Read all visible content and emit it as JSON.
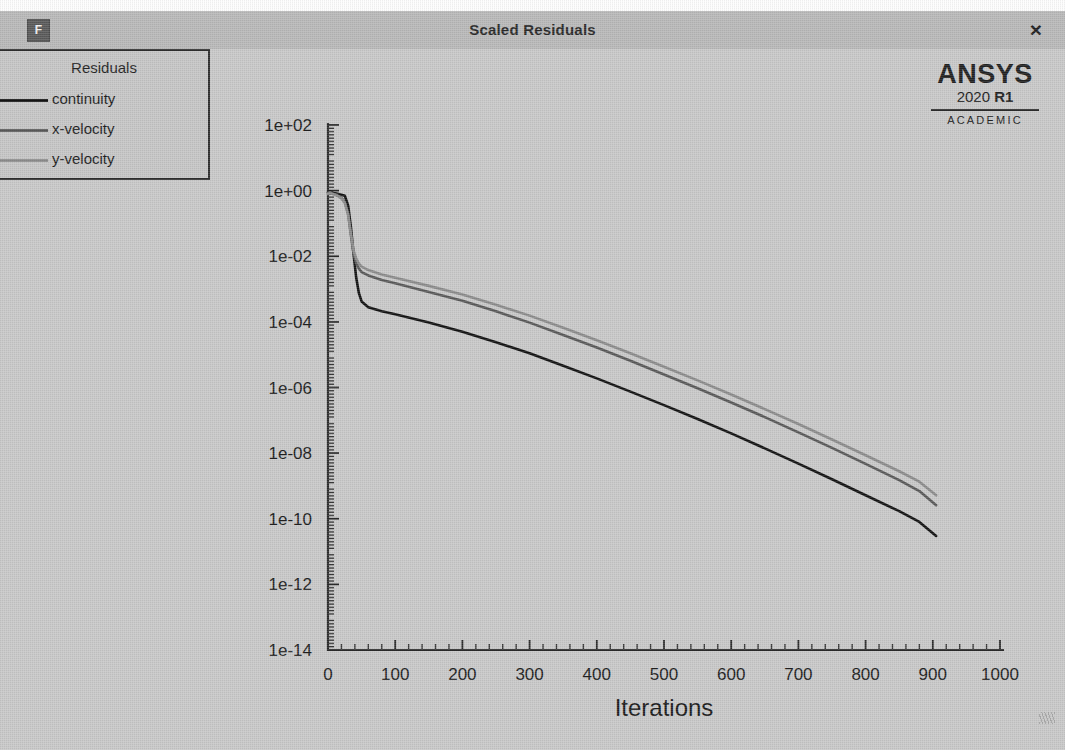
{
  "window": {
    "title": "Scaled Residuals",
    "app_icon_label": "F",
    "close_label": "×"
  },
  "branding": {
    "brand": "ANSYS",
    "version_year": "2020",
    "version_release": "R1",
    "license": "ACADEMIC"
  },
  "legend": {
    "title": "Residuals",
    "items": [
      {
        "label": "continuity",
        "color": "#141414"
      },
      {
        "label": "x-velocity",
        "color": "#5a5a5a"
      },
      {
        "label": "y-velocity",
        "color": "#8c8c8c"
      }
    ]
  },
  "chart_data": {
    "type": "line",
    "title": "Scaled Residuals",
    "xlabel": "Iterations",
    "ylabel": "",
    "yscale": "log",
    "xlim": [
      0,
      1000
    ],
    "ylim": [
      1e-14,
      100.0
    ],
    "grid": false,
    "legend_position": "top-left",
    "xticks": [
      0,
      100,
      200,
      300,
      400,
      500,
      600,
      700,
      800,
      900,
      1000
    ],
    "xtick_labels": [
      "0",
      "100",
      "200",
      "300",
      "400",
      "500",
      "600",
      "700",
      "800",
      "900",
      "1000"
    ],
    "xminor_step": 20,
    "yticks": [
      100.0,
      1,
      0.01,
      0.0001,
      1e-06,
      1e-08,
      1e-10,
      1e-12,
      1e-14
    ],
    "ytick_labels": [
      "1e+02",
      "1e+00",
      "1e-02",
      "1e-04",
      "1e-06",
      "1e-08",
      "1e-10",
      "1e-12",
      "1e-14"
    ],
    "series": [
      {
        "name": "continuity",
        "color": "#141414",
        "width": 2.6,
        "x": [
          0,
          3,
          8,
          14,
          20,
          25,
          30,
          34,
          38,
          42,
          46,
          50,
          60,
          80,
          100,
          150,
          200,
          250,
          300,
          350,
          400,
          450,
          500,
          550,
          600,
          650,
          700,
          750,
          800,
          850,
          880,
          905
        ],
        "y": [
          0.9,
          0.95,
          0.85,
          0.8,
          0.75,
          0.7,
          0.35,
          0.08,
          0.012,
          0.0022,
          0.00075,
          0.00042,
          0.00028,
          0.00021,
          0.00017,
          9.5e-05,
          5e-05,
          2.4e-05,
          1.1e-05,
          4.6e-06,
          1.9e-06,
          7.5e-07,
          2.9e-07,
          1.1e-07,
          4e-08,
          1.4e-08,
          4.8e-09,
          1.6e-09,
          5.2e-10,
          1.7e-10,
          8e-11,
          3e-11
        ]
      },
      {
        "name": "x-velocity",
        "color": "#5a5a5a",
        "width": 2.6,
        "x": [
          0,
          3,
          8,
          14,
          20,
          25,
          30,
          34,
          38,
          42,
          46,
          50,
          60,
          80,
          100,
          150,
          200,
          250,
          300,
          350,
          400,
          450,
          500,
          550,
          600,
          650,
          700,
          750,
          800,
          850,
          880,
          905
        ],
        "y": [
          0.85,
          0.9,
          0.8,
          0.72,
          0.6,
          0.45,
          0.2,
          0.045,
          0.012,
          0.0062,
          0.0042,
          0.0033,
          0.0026,
          0.0019,
          0.0015,
          0.00082,
          0.00044,
          0.00021,
          9.5e-05,
          4e-05,
          1.65e-05,
          6.5e-06,
          2.5e-06,
          9.5e-07,
          3.5e-07,
          1.25e-07,
          4.3e-08,
          1.45e-08,
          4.7e-09,
          1.5e-09,
          7e-10,
          2.6e-10
        ]
      },
      {
        "name": "y-velocity",
        "color": "#8c8c8c",
        "width": 2.6,
        "x": [
          0,
          3,
          8,
          14,
          20,
          25,
          30,
          34,
          38,
          42,
          46,
          50,
          60,
          80,
          100,
          150,
          200,
          250,
          300,
          350,
          400,
          450,
          500,
          550,
          600,
          650,
          700,
          750,
          800,
          850,
          880,
          905
        ],
        "y": [
          0.8,
          0.85,
          0.78,
          0.7,
          0.58,
          0.42,
          0.18,
          0.05,
          0.015,
          0.0085,
          0.006,
          0.0048,
          0.0038,
          0.0028,
          0.0022,
          0.00125,
          0.00068,
          0.00033,
          0.000155,
          6.6e-05,
          2.75e-05,
          1.1e-05,
          4.3e-06,
          1.65e-06,
          6.1e-07,
          2.2e-07,
          7.7e-08,
          2.6e-08,
          8.6e-09,
          2.8e-09,
          1.35e-09,
          5.2e-10
        ]
      }
    ]
  }
}
